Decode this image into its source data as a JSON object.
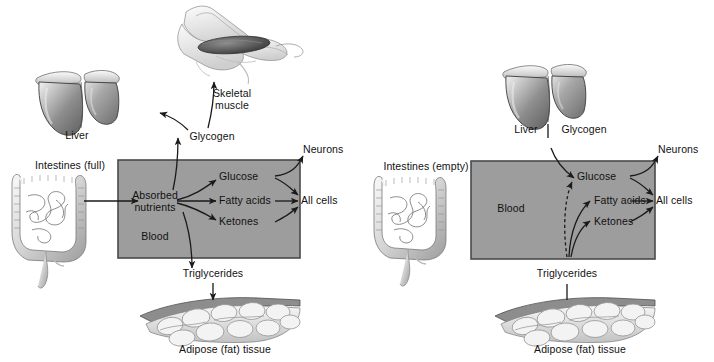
{
  "figure": {
    "type": "diagram",
    "panel_count": 2
  },
  "colors": {
    "blood_box_fill": "#9d9d9d",
    "blood_box_border": "#4a4a4a",
    "line": "#1a1a1a",
    "organ_dark": "#6b6b6b",
    "organ_mid": "#a8a8a8",
    "organ_light": "#e8e8e8",
    "background": "#ffffff"
  },
  "panels": [
    {
      "id": "fed-state",
      "name": "left-panel-fed-state",
      "state": "full",
      "labels": {
        "intestines": "Intestines (full)",
        "liver": "Liver",
        "glycogen": "Glycogen",
        "skeletal_muscle": "Skeletal\nmuscle",
        "skeletal_muscle_line1": "Skeletal",
        "skeletal_muscle_line2": "muscle",
        "blood": "Blood",
        "hub_line1": "Absorbed",
        "hub_line2": "nutrients",
        "glucose": "Glucose",
        "fatty_acids": "Fatty acids",
        "ketones": "Ketones",
        "neurons": "Neurons",
        "all_cells": "All cells",
        "triglycerides": "Triglycerides",
        "adipose": "Adipose (fat) tissue"
      },
      "flows": [
        {
          "from": "Intestines (full)",
          "to": "Absorbed nutrients",
          "style": "solid",
          "direction": "right"
        },
        {
          "from": "Absorbed nutrients",
          "to": "Glycogen (liver)",
          "style": "solid",
          "direction": "up"
        },
        {
          "from": "Glycogen",
          "to": "Liver",
          "style": "solid",
          "direction": "up-left"
        },
        {
          "from": "Glycogen",
          "to": "Skeletal muscle",
          "style": "solid",
          "direction": "up-right"
        },
        {
          "from": "Absorbed nutrients",
          "to": "Glucose",
          "style": "solid",
          "direction": "up-right"
        },
        {
          "from": "Absorbed nutrients",
          "to": "Fatty acids",
          "style": "solid",
          "direction": "right"
        },
        {
          "from": "Absorbed nutrients",
          "to": "Ketones",
          "style": "solid",
          "direction": "down-right"
        },
        {
          "from": "Absorbed nutrients",
          "to": "Triglycerides",
          "style": "solid",
          "direction": "down"
        },
        {
          "from": "Triglycerides",
          "to": "Adipose (fat) tissue",
          "style": "solid",
          "direction": "down"
        },
        {
          "from": "Glucose",
          "to": "Neurons",
          "style": "solid",
          "direction": "up-right"
        },
        {
          "from": "Glucose",
          "to": "All cells",
          "style": "solid",
          "direction": "right"
        },
        {
          "from": "Fatty acids",
          "to": "All cells",
          "style": "solid",
          "direction": "right"
        },
        {
          "from": "Ketones",
          "to": "All cells",
          "style": "solid",
          "direction": "right"
        }
      ]
    },
    {
      "id": "fasting-state",
      "name": "right-panel-fasting-state",
      "state": "empty",
      "labels": {
        "intestines": "Intestines (empty)",
        "liver": "Liver",
        "glycogen": "Glycogen",
        "blood": "Blood",
        "glucose": "Glucose",
        "fatty_acids": "Fatty acids",
        "ketones": "Ketones",
        "neurons": "Neurons",
        "all_cells": "All cells",
        "triglycerides": "Triglycerides",
        "adipose": "Adipose (fat) tissue"
      },
      "flows": [
        {
          "from": "Glycogen (liver)",
          "to": "Glucose",
          "style": "solid",
          "direction": "down-right"
        },
        {
          "from": "Triglycerides",
          "to": "Glucose",
          "style": "dashed",
          "direction": "up-right"
        },
        {
          "from": "Triglycerides",
          "to": "Fatty acids",
          "style": "solid",
          "direction": "up-right"
        },
        {
          "from": "Triglycerides",
          "to": "Ketones",
          "style": "solid",
          "direction": "up-right"
        },
        {
          "from": "Adipose (fat) tissue",
          "to": "Triglycerides",
          "style": "solid",
          "direction": "up"
        },
        {
          "from": "Glucose",
          "to": "Neurons",
          "style": "solid",
          "direction": "up-right"
        },
        {
          "from": "Glucose",
          "to": "All cells",
          "style": "solid",
          "direction": "right"
        },
        {
          "from": "Fatty acids",
          "to": "All cells",
          "style": "solid",
          "direction": "right"
        },
        {
          "from": "Ketones",
          "to": "All cells",
          "style": "solid",
          "direction": "right"
        }
      ]
    }
  ]
}
